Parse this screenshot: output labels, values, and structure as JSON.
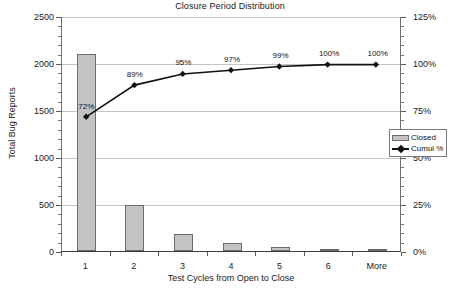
{
  "chart_data": {
    "type": "bar",
    "title": "Closure Period Distribution",
    "xlabel": "Test Cycles from Open to Close",
    "ylabel": "Total Bug Reports",
    "y2label": "",
    "categories": [
      "1",
      "2",
      "3",
      "4",
      "5",
      "6",
      "More"
    ],
    "series": [
      {
        "name": "Closed",
        "type": "bar",
        "axis": "left",
        "values": [
          2100,
          490,
          185,
          85,
          40,
          20,
          10
        ]
      },
      {
        "name": "Cumul %",
        "type": "line",
        "axis": "right",
        "values": [
          72,
          89,
          95,
          97,
          99,
          100,
          100
        ],
        "labels": [
          "72%",
          "89%",
          "95%",
          "97%",
          "99%",
          "100%",
          "100%"
        ]
      }
    ],
    "ylim": [
      0,
      2500
    ],
    "yticks": [
      0,
      500,
      1000,
      1500,
      2000,
      2500
    ],
    "ytick_labels": [
      "0",
      "500",
      "1000",
      "1500",
      "2000",
      "2500"
    ],
    "y2lim": [
      0,
      125
    ],
    "y2ticks": [
      0,
      25,
      50,
      75,
      100,
      125
    ],
    "y2tick_labels": [
      "0%",
      "25%",
      "50%",
      "75%",
      "100%",
      "125%"
    ],
    "grid": true,
    "legend_position": "right-middle"
  },
  "legend": {
    "items": [
      {
        "label": "Closed",
        "marker": "bar-swatch",
        "color": "#c3c3c3"
      },
      {
        "label": "Cumul %",
        "marker": "line-diamond",
        "color": "#111111"
      }
    ]
  },
  "colors": {
    "bar_fill": "#c3c3c3",
    "bar_border": "#6b6b6b",
    "line": "#111111",
    "grid": "#c4c4c4",
    "axis": "#5a5a5a",
    "text": "#1a1a1a",
    "background": "#ffffff"
  }
}
